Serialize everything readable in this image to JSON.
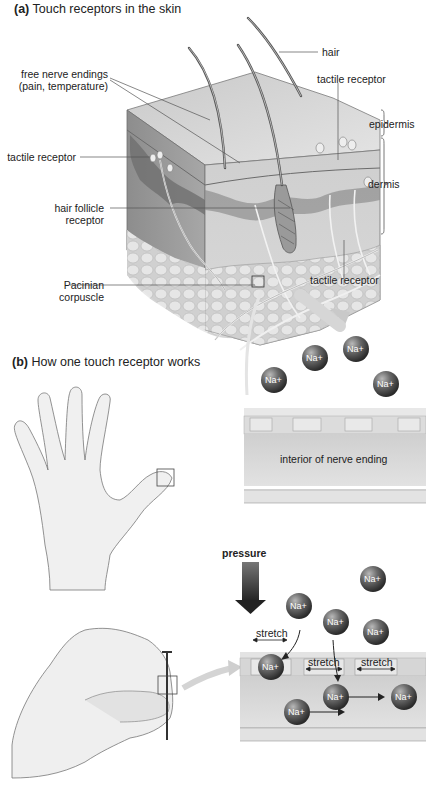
{
  "panel_a": {
    "letter": "(a)",
    "title": "Touch receptors in the skin",
    "labels": {
      "hair": "hair",
      "free_nerve_endings_1": "free nerve endings",
      "free_nerve_endings_2": "(pain, temperature)",
      "tactile_receptor_top": "tactile receptor",
      "epidermis": "epidermis",
      "tactile_receptor_left": "tactile receptor",
      "dermis": "dermis",
      "hair_follicle_1": "hair follicle",
      "hair_follicle_2": "receptor",
      "pacinian_1": "Pacinian",
      "pacinian_2": "corpuscle",
      "tactile_receptor_bottom": "tactile receptor"
    }
  },
  "panel_b": {
    "letter": "(b)",
    "title": "How one touch receptor works",
    "resting": {
      "interior_label": "interior of nerve ending",
      "ions": [
        "Na+",
        "Na+",
        "Na+",
        "Na+"
      ]
    },
    "pressed": {
      "pressure_label": "pressure",
      "stretch_labels": [
        "stretch",
        "stretch",
        "stretch"
      ],
      "ions": [
        "Na+",
        "Na+",
        "Na+",
        "Na+",
        "Na+",
        "Na+",
        "Na+",
        "Na+"
      ]
    }
  }
}
